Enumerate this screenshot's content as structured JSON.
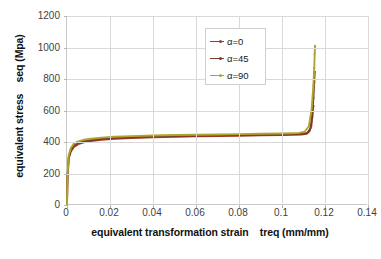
{
  "chart_data": {
    "type": "line",
    "title": "",
    "xlabel": "equivalent transformation strain    treq (mm/mm)",
    "ylabel": "equivalent stress    seq (Mpa)",
    "xlim": [
      0,
      0.14
    ],
    "ylim": [
      0,
      1200
    ],
    "xticks": [
      "0",
      "0.02",
      "0.04",
      "0.06",
      "0.08",
      "0.1",
      "0.12",
      "0.14"
    ],
    "xtick_values": [
      0,
      0.02,
      0.04,
      0.06,
      0.08,
      0.1,
      0.12,
      0.14
    ],
    "yticks": [
      "0",
      "200",
      "400",
      "600",
      "800",
      "1000",
      "1200"
    ],
    "ytick_values": [
      0,
      200,
      400,
      600,
      800,
      1000,
      1200
    ],
    "grid": true,
    "legend_position": "top-center-right",
    "series": [
      {
        "name": "α=0",
        "color": "#9c3b2e",
        "marker": "dot",
        "x": [
          0,
          0.0002,
          0.0008,
          0.0018,
          0.0032,
          0.0052,
          0.0078,
          0.011,
          0.016,
          0.022,
          0.03,
          0.04,
          0.05,
          0.06,
          0.07,
          0.08,
          0.09,
          0.1,
          0.105,
          0.109,
          0.1115,
          0.1128,
          0.1136,
          0.1141,
          0.1144,
          0.1146
        ],
        "y": [
          0,
          160,
          295,
          340,
          368,
          386,
          398,
          406,
          414,
          420,
          425,
          430,
          433,
          436,
          438,
          440,
          442,
          444,
          445,
          447,
          452,
          468,
          500,
          560,
          620,
          628
        ]
      },
      {
        "name": "α=45",
        "color": "#7a3b2a",
        "marker": "dot",
        "x": [
          0,
          0.0002,
          0.0008,
          0.0018,
          0.0032,
          0.0052,
          0.0078,
          0.011,
          0.016,
          0.022,
          0.03,
          0.04,
          0.05,
          0.06,
          0.07,
          0.08,
          0.09,
          0.1,
          0.105,
          0.109,
          0.1118,
          0.1132,
          0.114,
          0.1146,
          0.115,
          0.1152
        ],
        "y": [
          0,
          170,
          305,
          350,
          378,
          394,
          405,
          413,
          420,
          426,
          431,
          436,
          439,
          441,
          443,
          445,
          447,
          449,
          450,
          452,
          458,
          485,
          560,
          680,
          780,
          845
        ]
      },
      {
        "name": "α=90",
        "color": "#b0a52b",
        "marker": "dot",
        "x": [
          0,
          0.0002,
          0.0008,
          0.0018,
          0.0032,
          0.0052,
          0.0078,
          0.011,
          0.016,
          0.022,
          0.03,
          0.04,
          0.05,
          0.06,
          0.07,
          0.08,
          0.09,
          0.1,
          0.105,
          0.108,
          0.1105,
          0.1125,
          0.1138,
          0.1146,
          0.115,
          0.1152,
          0.1154
        ],
        "y": [
          0,
          180,
          318,
          362,
          390,
          404,
          414,
          421,
          428,
          433,
          437,
          441,
          444,
          446,
          448,
          450,
          452,
          454,
          456,
          458,
          465,
          500,
          610,
          760,
          870,
          960,
          1010
        ]
      }
    ]
  },
  "legend": {
    "items": [
      {
        "label": "α=0"
      },
      {
        "label": "α=45"
      },
      {
        "label": "α=90"
      }
    ]
  }
}
